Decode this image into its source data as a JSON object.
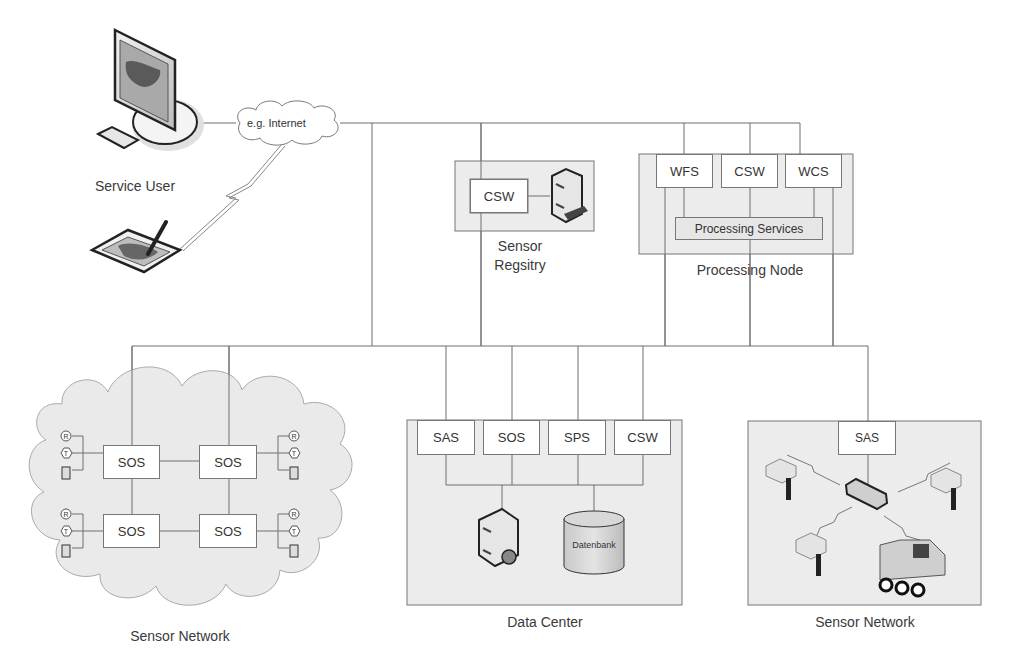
{
  "diagram": {
    "service_user": {
      "label": "Service User",
      "network_label": "e.g. Internet",
      "icons": [
        "desktop-monitor-icon",
        "keyboard-icon",
        "tablet-pen-icon"
      ]
    },
    "sensor_registry": {
      "label_line1": "Sensor",
      "label_line2": "Regsitry",
      "services": [
        "CSW"
      ],
      "icons": [
        "server-icon"
      ]
    },
    "processing_node": {
      "label": "Processing Node",
      "services": [
        "WFS",
        "CSW",
        "WCS"
      ],
      "processing_label": "Processing Services"
    },
    "sensor_network_left": {
      "label": "Sensor Network",
      "services": [
        "SOS",
        "SOS",
        "SOS",
        "SOS"
      ],
      "sensor_icon_labels": [
        "R",
        "T",
        "H"
      ]
    },
    "data_center": {
      "label": "Data Center",
      "services": [
        "SAS",
        "SOS",
        "SPS",
        "CSW"
      ],
      "database_label": "Datenbank",
      "icons": [
        "server-icon",
        "database-icon"
      ]
    },
    "sensor_network_right": {
      "label": "Sensor Network",
      "services": [
        "SAS"
      ],
      "icons": [
        "hub-icon",
        "sensor-node-icon",
        "robot-vehicle-icon"
      ]
    },
    "colors": {
      "line": "#6e6e6e",
      "panel_fill": "#ececec",
      "box_fill": "#ffffff",
      "text": "#333333"
    }
  }
}
